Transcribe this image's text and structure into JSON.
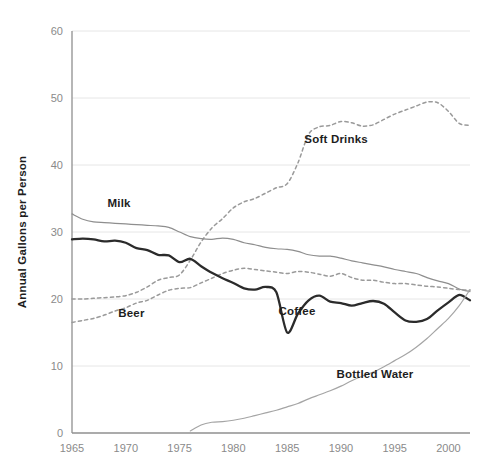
{
  "chart_data": {
    "type": "line",
    "title": "",
    "xlabel": "",
    "ylabel": "Annual Gallons per Person",
    "xlim": [
      1965,
      2002
    ],
    "ylim": [
      0,
      60
    ],
    "grid": true,
    "legend_position": "inline-labels",
    "xticks": [
      "1965",
      "1970",
      "1975",
      "1980",
      "1985",
      "1990",
      "1995",
      "2000"
    ],
    "xtick_values": [
      1965,
      1970,
      1975,
      1980,
      1985,
      1990,
      1995,
      2000
    ],
    "yticks": [
      "0",
      "10",
      "20",
      "30",
      "40",
      "50",
      "60"
    ],
    "ytick_values": [
      0,
      10,
      20,
      30,
      40,
      50,
      60
    ],
    "x": [
      1965,
      1966,
      1967,
      1968,
      1969,
      1970,
      1971,
      1972,
      1973,
      1974,
      1975,
      1976,
      1977,
      1978,
      1979,
      1980,
      1981,
      1982,
      1983,
      1984,
      1985,
      1986,
      1987,
      1988,
      1989,
      1990,
      1991,
      1992,
      1993,
      1994,
      1995,
      1996,
      1997,
      1998,
      1999,
      2000,
      2001,
      2002
    ],
    "series": [
      {
        "name": "Soft Drinks",
        "style": "dashed",
        "color": "#9a9a9a",
        "label_x": 1986.6,
        "label_y": 43.3,
        "values": [
          20.0,
          20.0,
          20.1,
          20.2,
          20.3,
          20.5,
          21.0,
          21.8,
          22.8,
          23.2,
          23.6,
          25.8,
          28.5,
          30.6,
          32.0,
          33.6,
          34.5,
          35.0,
          35.8,
          36.6,
          37.2,
          40.3,
          44.6,
          45.7,
          45.9,
          46.5,
          46.3,
          45.8,
          46.0,
          46.8,
          47.6,
          48.2,
          48.8,
          49.4,
          49.3,
          48.0,
          46.2,
          45.9
        ]
      },
      {
        "name": "Milk",
        "style": "solid-thin",
        "color": "#8e8e8e",
        "label_x": 1968.3,
        "label_y": 33.7,
        "values": [
          32.7,
          31.9,
          31.5,
          31.4,
          31.3,
          31.2,
          31.1,
          31.0,
          30.9,
          30.7,
          30.0,
          29.3,
          29.0,
          28.9,
          29.1,
          28.9,
          28.4,
          28.1,
          27.7,
          27.5,
          27.4,
          27.1,
          26.6,
          26.4,
          26.4,
          26.1,
          25.7,
          25.4,
          25.1,
          24.8,
          24.4,
          24.1,
          23.8,
          23.2,
          22.7,
          22.3,
          21.5,
          21.1
        ]
      },
      {
        "name": "Beer",
        "style": "dashed",
        "color": "#9a9a9a",
        "label_x": 1969.3,
        "label_y": 17.3,
        "values": [
          16.5,
          16.8,
          17.1,
          17.6,
          18.2,
          18.7,
          19.4,
          19.8,
          20.6,
          21.3,
          21.6,
          21.7,
          22.4,
          23.1,
          23.8,
          24.3,
          24.6,
          24.4,
          24.2,
          24.0,
          23.8,
          24.1,
          24.0,
          23.7,
          23.4,
          23.8,
          23.2,
          22.8,
          22.8,
          22.5,
          22.3,
          22.3,
          22.1,
          21.9,
          21.8,
          21.6,
          21.4,
          21.3
        ]
      },
      {
        "name": "Coffee",
        "style": "solid-bold",
        "color": "#2b2b2b",
        "label_x": 1984.2,
        "label_y": 17.6,
        "values": [
          28.9,
          29.0,
          28.9,
          28.6,
          28.7,
          28.4,
          27.6,
          27.3,
          26.6,
          26.5,
          25.5,
          26.0,
          24.9,
          23.9,
          23.1,
          22.4,
          21.6,
          21.4,
          21.8,
          21.0,
          15.0,
          17.8,
          19.8,
          20.5,
          19.6,
          19.4,
          19.0,
          19.4,
          19.7,
          19.3,
          18.0,
          16.8,
          16.6,
          17.0,
          18.3,
          19.5,
          20.6,
          19.8
        ]
      },
      {
        "name": "Bottled Water",
        "style": "solid-thin",
        "color": "#a5a5a5",
        "label_x": 1989.6,
        "label_y": 8.2,
        "values": [
          0.0,
          0.0,
          0.0,
          0.0,
          0.0,
          0.0,
          0.0,
          0.0,
          0.0,
          0.0,
          0.0,
          0.3,
          1.2,
          1.6,
          1.7,
          1.9,
          2.2,
          2.6,
          3.0,
          3.4,
          3.9,
          4.4,
          5.1,
          5.7,
          6.3,
          7.0,
          7.8,
          8.5,
          9.1,
          9.9,
          10.8,
          11.7,
          12.8,
          14.1,
          15.6,
          17.1,
          19.0,
          21.4
        ]
      }
    ]
  }
}
